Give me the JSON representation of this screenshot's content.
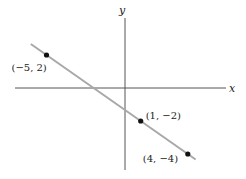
{
  "chart_data": {
    "type": "line",
    "title": "",
    "xlabel": "x",
    "ylabel": "y",
    "xlim": [
      -7,
      6.5
    ],
    "ylim": [
      -5,
      4.2
    ],
    "grid": false,
    "line": {
      "x": [
        -6,
        4.5
      ],
      "y": [
        2.67,
        -4.33
      ],
      "color": "#a8a8a8"
    },
    "points": [
      {
        "x": -5,
        "y": 2,
        "label": "(−5, 2)",
        "label_pos": "below-left"
      },
      {
        "x": 1,
        "y": -2,
        "label": "(1, −2)",
        "label_pos": "right"
      },
      {
        "x": 4,
        "y": -4,
        "label": "(4, −4)",
        "label_pos": "left"
      }
    ]
  }
}
